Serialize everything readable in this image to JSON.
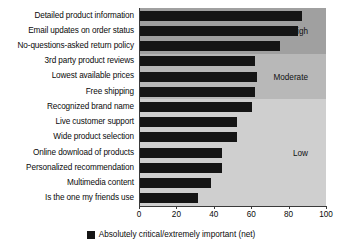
{
  "chart_data": {
    "type": "bar",
    "orientation": "horizontal",
    "title": "",
    "xlabel": "",
    "ylabel": "",
    "xlim": [
      0,
      100
    ],
    "xticks": [
      0,
      20,
      40,
      60,
      80,
      100
    ],
    "grid": false,
    "legend_position": "bottom-center",
    "legend": [
      "Absolutely critical/extremely important (net)"
    ],
    "bar_color": "#151515",
    "categories": [
      "Detailed product information",
      "Email updates on order status",
      "No-questions-asked return policy",
      "3rd party product reviews",
      "Lowest available prices",
      "Free shipping",
      "Recognized brand name",
      "Live customer support",
      "Wide product selection",
      "Online download of products",
      "Personalized recommendation",
      "Multimedia content",
      "Is the one my friends use"
    ],
    "values": [
      87,
      85,
      75,
      62,
      63,
      62,
      60,
      52,
      52,
      44,
      44,
      38,
      31
    ],
    "bands": [
      {
        "label": "High",
        "color": "#a0a0a0",
        "start_index": 0,
        "end_index": 2
      },
      {
        "label": "Moderate",
        "color": "#b8b8b8",
        "start_index": 3,
        "end_index": 5
      },
      {
        "label": "Low",
        "color": "#cfcfcf",
        "start_index": 6,
        "end_index": 12
      }
    ]
  }
}
